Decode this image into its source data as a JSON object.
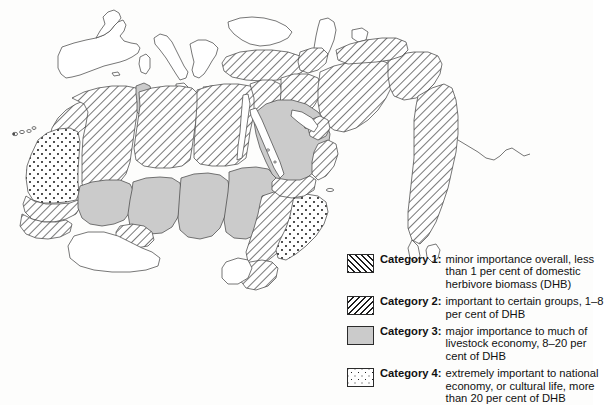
{
  "map": {
    "title": "Distribution of camel importance by country",
    "background_color": "#fdfdfc",
    "outline_color": "#4a4a4a",
    "category3_fill": "#cbcbcb",
    "hatch_color": "#1d1d1d"
  },
  "legend": {
    "items": [
      {
        "swatch": "diagonal-hatch-forward",
        "label": "Category 1:",
        "lines": [
          "minor importance overall, less",
          "than 1 per cent of domestic",
          "herbivore biomass (DHB)"
        ]
      },
      {
        "swatch": "diagonal-hatch-backward",
        "label": "Category 2:",
        "lines": [
          "important to certain groups, 1–8",
          "per cent of DHB"
        ]
      },
      {
        "swatch": "solid-gray",
        "label": "Category 3:",
        "lines": [
          "major importance to much of",
          "livestock economy, 8–20 per",
          "cent of DHB"
        ]
      },
      {
        "swatch": "stippled-dots",
        "label": "Category 4:",
        "lines": [
          "extremely important to national",
          "economy, or cultural life, more",
          "than 20 per cent of DHB"
        ]
      }
    ]
  },
  "regions": [
    {
      "name": "western-sahara-mauritania",
      "category": 4
    },
    {
      "name": "morocco",
      "category": 1
    },
    {
      "name": "algeria",
      "category": 1
    },
    {
      "name": "tunisia",
      "category": 3
    },
    {
      "name": "libya",
      "category": 1
    },
    {
      "name": "egypt",
      "category": 1
    },
    {
      "name": "mali",
      "category": 3
    },
    {
      "name": "niger",
      "category": 3
    },
    {
      "name": "chad",
      "category": 3
    },
    {
      "name": "sudan",
      "category": 3
    },
    {
      "name": "senegal-gambia",
      "category": 1
    },
    {
      "name": "burkina-faso",
      "category": 1
    },
    {
      "name": "turkey",
      "category": 1
    },
    {
      "name": "syria-lebanon-jordan-israel",
      "category": 1
    },
    {
      "name": "iraq",
      "category": 1
    },
    {
      "name": "iran",
      "category": 1
    },
    {
      "name": "afghanistan",
      "category": 1
    },
    {
      "name": "pakistan-india",
      "category": 1
    },
    {
      "name": "saudi-arabia",
      "category": 3
    },
    {
      "name": "yemen",
      "category": 1
    },
    {
      "name": "oman",
      "category": 1
    },
    {
      "name": "gulf-states",
      "category": 1
    },
    {
      "name": "ethiopia",
      "category": 1
    },
    {
      "name": "somalia",
      "category": 4
    },
    {
      "name": "djibouti",
      "category": 4
    },
    {
      "name": "kenya-north",
      "category": 1
    },
    {
      "name": "canary-islands",
      "category": 4
    },
    {
      "name": "europe-unshaded",
      "category": 0
    },
    {
      "name": "central-africa-unshaded",
      "category": 0
    }
  ]
}
